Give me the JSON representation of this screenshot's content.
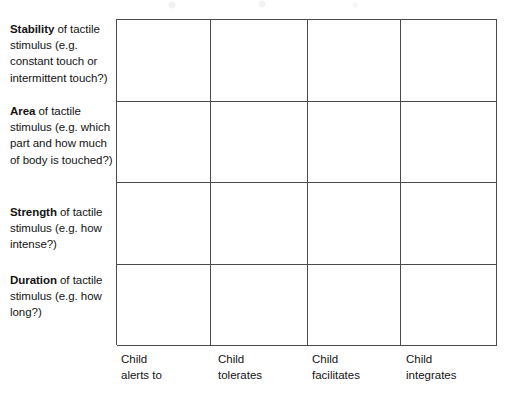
{
  "table": {
    "row_labels": [
      {
        "keyword": "Stability",
        "rest": " of tactile stimulus (e.g. constant touch or intermittent touch?)"
      },
      {
        "keyword": "Area",
        "rest": " of tactile stimulus (e.g. which part and how much of body is touched?)"
      },
      {
        "keyword": "Strength",
        "rest": " of tactile stimulus (e.g. how intense?)"
      },
      {
        "keyword": "Duration",
        "rest": " of tactile stimulus (e.g. how long?)"
      }
    ],
    "column_headers": [
      {
        "line1": "Child",
        "line2": "alerts to"
      },
      {
        "line1": "Child",
        "line2": "tolerates"
      },
      {
        "line1": "Child",
        "line2": "facilitates"
      },
      {
        "line1": "Child",
        "line2": "integrates"
      }
    ],
    "cells": [
      [
        "",
        "",
        "",
        ""
      ],
      [
        "",
        "",
        "",
        ""
      ],
      [
        "",
        "",
        "",
        ""
      ],
      [
        "",
        "",
        "",
        ""
      ]
    ],
    "border_color": "#4a4a4a",
    "text_color": "#141414"
  }
}
